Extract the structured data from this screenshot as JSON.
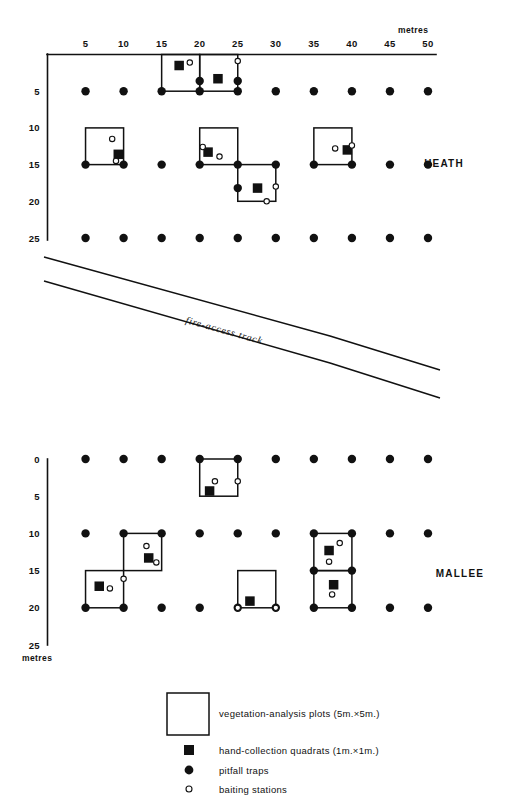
{
  "figure": {
    "type": "site-sampling-map",
    "units_label": "metres",
    "x_axis": {
      "ticks": [
        5,
        10,
        15,
        20,
        25,
        30,
        35,
        40,
        45,
        50
      ],
      "min": 0,
      "max": 50
    },
    "sites": [
      {
        "id": "heath",
        "label": "HEATH",
        "y_axis": {
          "ticks": [
            5,
            10,
            15,
            20,
            25
          ],
          "min": 0,
          "max": 25
        },
        "units_label": "metres",
        "pitfall_traps": [
          {
            "x": 5,
            "y": 5
          },
          {
            "x": 10,
            "y": 5
          },
          {
            "x": 15,
            "y": 5
          },
          {
            "x": 20,
            "y": 5
          },
          {
            "x": 25,
            "y": 5
          },
          {
            "x": 30,
            "y": 5
          },
          {
            "x": 35,
            "y": 5
          },
          {
            "x": 40,
            "y": 5
          },
          {
            "x": 45,
            "y": 5
          },
          {
            "x": 50,
            "y": 5
          },
          {
            "x": 5,
            "y": 15
          },
          {
            "x": 10,
            "y": 15
          },
          {
            "x": 15,
            "y": 15
          },
          {
            "x": 20,
            "y": 15
          },
          {
            "x": 25,
            "y": 15
          },
          {
            "x": 30,
            "y": 15
          },
          {
            "x": 35,
            "y": 15
          },
          {
            "x": 40,
            "y": 15
          },
          {
            "x": 45,
            "y": 15
          },
          {
            "x": 50,
            "y": 15
          },
          {
            "x": 5,
            "y": 25
          },
          {
            "x": 10,
            "y": 25
          },
          {
            "x": 15,
            "y": 25
          },
          {
            "x": 20,
            "y": 25
          },
          {
            "x": 25,
            "y": 25
          },
          {
            "x": 30,
            "y": 25
          },
          {
            "x": 35,
            "y": 25
          },
          {
            "x": 40,
            "y": 25
          },
          {
            "x": 45,
            "y": 25
          },
          {
            "x": 50,
            "y": 25
          },
          {
            "x": 20,
            "y": 3.6
          },
          {
            "x": 25,
            "y": 3.6
          },
          {
            "x": 25,
            "y": 18.2
          }
        ],
        "vegetation_plots": [
          {
            "x": 15,
            "y": 0,
            "w": 5,
            "h": 5
          },
          {
            "x": 20,
            "y": 0,
            "w": 5,
            "h": 5
          },
          {
            "x": 5,
            "y": 10,
            "w": 5,
            "h": 5
          },
          {
            "x": 20,
            "y": 10,
            "w": 5,
            "h": 5
          },
          {
            "x": 25,
            "y": 15,
            "w": 5,
            "h": 5
          },
          {
            "x": 35,
            "y": 10,
            "w": 5,
            "h": 5
          }
        ],
        "hand_collection_quadrats": [
          {
            "x": 17.3,
            "y": 1.5
          },
          {
            "x": 22.4,
            "y": 3.3
          },
          {
            "x": 9.3,
            "y": 13.6
          },
          {
            "x": 21.1,
            "y": 13.3
          },
          {
            "x": 27.6,
            "y": 18.2
          },
          {
            "x": 39.4,
            "y": 13.0
          }
        ],
        "baiting_stations": [
          {
            "x": 18.7,
            "y": 1.1
          },
          {
            "x": 25.0,
            "y": 0.9
          },
          {
            "x": 8.5,
            "y": 11.5
          },
          {
            "x": 9.0,
            "y": 14.5
          },
          {
            "x": 20.4,
            "y": 12.6
          },
          {
            "x": 22.6,
            "y": 13.9
          },
          {
            "x": 30.0,
            "y": 18.0
          },
          {
            "x": 28.8,
            "y": 20.0
          },
          {
            "x": 37.8,
            "y": 12.8
          },
          {
            "x": 40.0,
            "y": 12.4
          }
        ]
      },
      {
        "id": "mallee",
        "label": "MALLEE",
        "y_axis": {
          "ticks": [
            0,
            5,
            10,
            15,
            20,
            25
          ],
          "min": 0,
          "max": 25
        },
        "units_label": "metres",
        "pitfall_traps": [
          {
            "x": 5,
            "y": 0
          },
          {
            "x": 10,
            "y": 0
          },
          {
            "x": 15,
            "y": 0
          },
          {
            "x": 20,
            "y": 0
          },
          {
            "x": 25,
            "y": 0
          },
          {
            "x": 30,
            "y": 0
          },
          {
            "x": 35,
            "y": 0
          },
          {
            "x": 40,
            "y": 0
          },
          {
            "x": 45,
            "y": 0
          },
          {
            "x": 50,
            "y": 0
          },
          {
            "x": 5,
            "y": 10
          },
          {
            "x": 10,
            "y": 10
          },
          {
            "x": 15,
            "y": 10
          },
          {
            "x": 20,
            "y": 10
          },
          {
            "x": 25,
            "y": 10
          },
          {
            "x": 30,
            "y": 10
          },
          {
            "x": 35,
            "y": 10
          },
          {
            "x": 40,
            "y": 10
          },
          {
            "x": 45,
            "y": 10
          },
          {
            "x": 50,
            "y": 10
          },
          {
            "x": 5,
            "y": 20
          },
          {
            "x": 10,
            "y": 20
          },
          {
            "x": 15,
            "y": 20
          },
          {
            "x": 20,
            "y": 20
          },
          {
            "x": 25,
            "y": 20
          },
          {
            "x": 30,
            "y": 20
          },
          {
            "x": 35,
            "y": 20
          },
          {
            "x": 40,
            "y": 20
          },
          {
            "x": 45,
            "y": 20
          },
          {
            "x": 50,
            "y": 20
          },
          {
            "x": 40,
            "y": 15
          },
          {
            "x": 35,
            "y": 15
          }
        ],
        "vegetation_plots": [
          {
            "x": 20,
            "y": 0,
            "w": 5,
            "h": 5
          },
          {
            "x": 10,
            "y": 10,
            "w": 5,
            "h": 5
          },
          {
            "x": 5,
            "y": 15,
            "w": 5,
            "h": 5
          },
          {
            "x": 25,
            "y": 15,
            "w": 5,
            "h": 5
          },
          {
            "x": 35,
            "y": 10,
            "w": 5,
            "h": 5
          },
          {
            "x": 35,
            "y": 15,
            "w": 5,
            "h": 5
          }
        ],
        "hand_collection_quadrats": [
          {
            "x": 21.3,
            "y": 4.3
          },
          {
            "x": 13.3,
            "y": 13.3
          },
          {
            "x": 6.8,
            "y": 17.1
          },
          {
            "x": 26.6,
            "y": 19.1
          },
          {
            "x": 37.0,
            "y": 12.3
          },
          {
            "x": 37.6,
            "y": 16.9
          }
        ],
        "baiting_stations": [
          {
            "x": 22.0,
            "y": 3.0
          },
          {
            "x": 25.0,
            "y": 3.0
          },
          {
            "x": 13.0,
            "y": 11.7
          },
          {
            "x": 14.3,
            "y": 13.9
          },
          {
            "x": 10.0,
            "y": 16.1
          },
          {
            "x": 8.2,
            "y": 17.4
          },
          {
            "x": 25.0,
            "y": 20.0
          },
          {
            "x": 30.0,
            "y": 20.0
          },
          {
            "x": 38.4,
            "y": 11.3
          },
          {
            "x": 37.0,
            "y": 13.8
          },
          {
            "x": 37.4,
            "y": 18.2
          }
        ]
      }
    ],
    "track": {
      "label": "fire-access   track"
    },
    "legend": {
      "items": [
        {
          "symbol": "open-square",
          "text": "vegetation-analysis  plots  (5m.×5m.)"
        },
        {
          "symbol": "filled-square",
          "text": "hand-collection  quadrats  (1m.×1m.)"
        },
        {
          "symbol": "filled-circle",
          "text": "pitfall traps"
        },
        {
          "symbol": "open-circle",
          "text": "baiting stations"
        }
      ]
    }
  }
}
